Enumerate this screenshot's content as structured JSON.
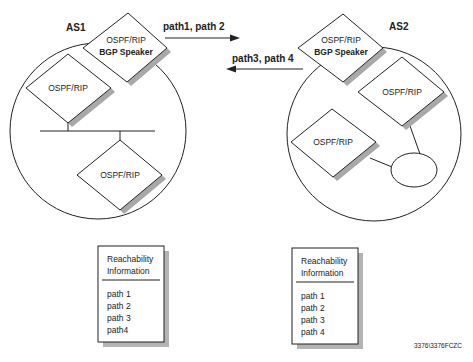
{
  "autonomous_systems": [
    {
      "label": "AS1",
      "bgp_router": {
        "line1": "OSPF/RIP",
        "line2": "BGP Speaker"
      },
      "routers": [
        {
          "label": "OSPF/RIP"
        },
        {
          "label": "OSPF/RIP"
        }
      ]
    },
    {
      "label": "AS2",
      "bgp_router": {
        "line1": "OSPF/RIP",
        "line2": "BGP Speaker"
      },
      "routers": [
        {
          "label": "OSPF/RIP"
        },
        {
          "label": "OSPF/RIP"
        }
      ]
    }
  ],
  "arrows": {
    "to_as2": "path1, path 2",
    "to_as1": "path3, path 4"
  },
  "reachability_tables": [
    {
      "title_line1": "Reachability",
      "title_line2": "Information",
      "paths": [
        "path 1",
        "path 2",
        "path 3",
        "path4"
      ]
    },
    {
      "title_line1": "Reachability",
      "title_line2": "Information",
      "paths": [
        "path 1",
        "path 2",
        "path 3",
        "path 4"
      ]
    }
  ],
  "figure_id": "3376\\3376FCZC",
  "colors": {
    "stroke": "#222222",
    "shadow": "#a8a8a8"
  }
}
